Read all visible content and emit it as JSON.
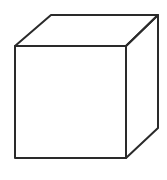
{
  "diagram": {
    "type": "cube-line-drawing",
    "stroke_color": "#2a2a2a",
    "background": "#ffffff",
    "vertices": {
      "front_top_left": [
        15,
        46
      ],
      "front_top_right": [
        126,
        46
      ],
      "front_bottom_left": [
        15,
        158
      ],
      "front_bottom_right": [
        126,
        158
      ],
      "back_top_left": [
        51,
        15
      ],
      "back_top_right": [
        158,
        15
      ],
      "back_bottom_right": [
        158,
        128
      ]
    }
  }
}
